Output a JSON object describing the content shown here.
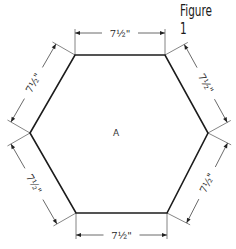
{
  "title": "Figure 1",
  "shape": "hexagon",
  "center_label": "A",
  "sides": [
    {
      "id": "top",
      "label": "7½\""
    },
    {
      "id": "upper-right",
      "label": "7½\""
    },
    {
      "id": "lower-right",
      "label": "7½\""
    },
    {
      "id": "bottom",
      "label": "7½\""
    },
    {
      "id": "lower-left",
      "label": "7½\""
    },
    {
      "id": "upper-left",
      "label": "7½\""
    }
  ],
  "colors": {
    "line": "#1c1c1c",
    "background": "#ffffff"
  }
}
